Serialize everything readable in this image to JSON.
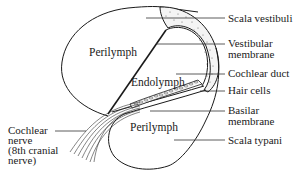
{
  "diagram": {
    "regions": {
      "upper_perilymph": "Perilymph",
      "endolymph": "Endolymph",
      "lower_perilymph": "Perilymph"
    },
    "labels_right": [
      {
        "id": "scala_vestibuli",
        "lines": [
          "Scala vestibuli"
        ]
      },
      {
        "id": "vestibular_membrane",
        "lines": [
          "Vestibular",
          "membrane"
        ]
      },
      {
        "id": "cochlear_duct",
        "lines": [
          "Cochlear duct"
        ]
      },
      {
        "id": "hair_cells",
        "lines": [
          "Hair cells"
        ]
      },
      {
        "id": "basilar_membrane",
        "lines": [
          "Basilar",
          "membrane"
        ]
      },
      {
        "id": "scala_typani",
        "lines": [
          "Scala typani"
        ]
      }
    ],
    "labels_left": [
      {
        "id": "cochlear_nerve",
        "lines": [
          "Cochlear",
          "nerve",
          "(8th cranial",
          "nerve)"
        ]
      }
    ],
    "colors": {
      "line": "#1a1a1a",
      "background": "#ffffff"
    }
  }
}
